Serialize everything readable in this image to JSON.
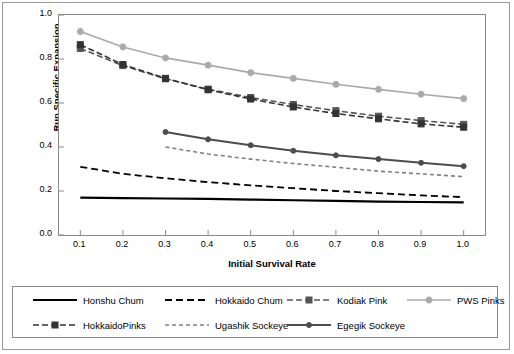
{
  "chart_data": {
    "type": "line",
    "title": "",
    "xlabel": "Initial Survival Rate",
    "ylabel": "Run Specific Expansion",
    "xlim": [
      0.05,
      1.05
    ],
    "ylim": [
      0.0,
      1.0
    ],
    "grid": false,
    "legend_position": "bottom",
    "xticks": [
      "0.1",
      "0.2",
      "0.3",
      "0.4",
      "0.5",
      "0.6",
      "0.7",
      "0.8",
      "0.9",
      "1.0"
    ],
    "yticks": [
      "0.0",
      "0.2",
      "0.4",
      "0.6",
      "0.8",
      "1.0"
    ],
    "x": [
      0.1,
      0.2,
      0.3,
      0.4,
      0.5,
      0.6,
      0.7,
      0.8,
      0.9,
      1.0
    ],
    "series": [
      {
        "name": "Honshu Chum",
        "style": "solid-thick-black-nomarker",
        "color": "#000000",
        "x": [
          0.1,
          0.2,
          0.3,
          0.4,
          0.5,
          0.6,
          0.7,
          0.8,
          0.9,
          1.0
        ],
        "values": [
          0.17,
          0.168,
          0.166,
          0.164,
          0.161,
          0.158,
          0.155,
          0.152,
          0.15,
          0.148
        ]
      },
      {
        "name": "Hokkaido Chum",
        "style": "dashed-black-nomarker",
        "color": "#000000",
        "x": [
          0.1,
          0.2,
          0.3,
          0.4,
          0.5,
          0.6,
          0.7,
          0.8,
          0.9,
          1.0
        ],
        "values": [
          0.31,
          0.278,
          0.258,
          0.24,
          0.226,
          0.213,
          0.2,
          0.19,
          0.18,
          0.172
        ]
      },
      {
        "name": "Kodiak Pink",
        "style": "dashed-dark-square-marker",
        "color": "#555555",
        "x": [
          0.1,
          0.2,
          0.3,
          0.4,
          0.5,
          0.6,
          0.7,
          0.8,
          0.9,
          1.0
        ],
        "values": [
          0.848,
          0.77,
          0.71,
          0.663,
          0.625,
          0.593,
          0.565,
          0.54,
          0.52,
          0.503
        ]
      },
      {
        "name": "PWS Pinks",
        "style": "solid-light-gray-star-marker",
        "color": "#aaaaaa",
        "x": [
          0.1,
          0.2,
          0.3,
          0.4,
          0.5,
          0.6,
          0.7,
          0.8,
          0.9,
          1.0
        ],
        "values": [
          0.925,
          0.855,
          0.805,
          0.772,
          0.738,
          0.712,
          0.685,
          0.662,
          0.64,
          0.62
        ]
      },
      {
        "name": "HokkaidoPinks",
        "style": "dashed-dark-square-marker",
        "color": "#333333",
        "x": [
          0.1,
          0.2,
          0.3,
          0.4,
          0.5,
          0.6,
          0.7,
          0.8,
          0.9,
          1.0
        ],
        "values": [
          0.865,
          0.775,
          0.712,
          0.66,
          0.618,
          0.582,
          0.552,
          0.528,
          0.505,
          0.49
        ]
      },
      {
        "name": "Ugashik Sockeye",
        "style": "dotted-gray-nomarker",
        "color": "#808080",
        "x": [
          0.3,
          0.4,
          0.5,
          0.6,
          0.7,
          0.8,
          0.9,
          1.0
        ],
        "values": [
          0.4,
          0.368,
          0.345,
          0.325,
          0.308,
          0.29,
          0.278,
          0.265
        ]
      },
      {
        "name": "Egegik Sockeye",
        "style": "solid-dark-gray-round-marker",
        "color": "#4d4d4d",
        "x": [
          0.3,
          0.4,
          0.5,
          0.6,
          0.7,
          0.8,
          0.9,
          1.0
        ],
        "values": [
          0.468,
          0.435,
          0.408,
          0.383,
          0.362,
          0.345,
          0.328,
          0.313
        ]
      }
    ]
  },
  "legend": {
    "row1": [
      "Honshu Chum",
      "Hokkaido Chum",
      "Kodiak Pink",
      "PWS Pinks"
    ],
    "row2": [
      "HokkaidoPinks",
      "Ugashik Sockeye",
      "Egegik Sockeye"
    ]
  }
}
